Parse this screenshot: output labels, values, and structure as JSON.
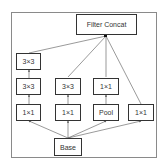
{
  "diagram": {
    "nodes": {
      "concat": {
        "label": "Filter Concat"
      },
      "c1_top": {
        "label": "3×3"
      },
      "c1_mid": {
        "label": "3×3"
      },
      "c1_bot": {
        "label": "1×1"
      },
      "c2_mid": {
        "label": "3×3"
      },
      "c2_bot": {
        "label": "1×1"
      },
      "c3_mid": {
        "label": "1×1"
      },
      "c3_bot": {
        "label": "Pool"
      },
      "c4_bot": {
        "label": "1×1"
      },
      "base": {
        "label": "Base"
      }
    },
    "edges": [
      [
        "base",
        "c1_bot"
      ],
      [
        "base",
        "c2_bot"
      ],
      [
        "base",
        "c3_bot"
      ],
      [
        "base",
        "c4_bot"
      ],
      [
        "c1_bot",
        "c1_mid"
      ],
      [
        "c1_mid",
        "c1_top"
      ],
      [
        "c2_bot",
        "c2_mid"
      ],
      [
        "c3_bot",
        "c3_mid"
      ],
      [
        "c1_top",
        "concat"
      ],
      [
        "c2_mid",
        "concat"
      ],
      [
        "c3_mid",
        "concat"
      ],
      [
        "c4_bot",
        "concat"
      ]
    ],
    "colors": {
      "box_border": "#333333",
      "frame": "#8a8a8a",
      "edge": "#555555"
    }
  }
}
